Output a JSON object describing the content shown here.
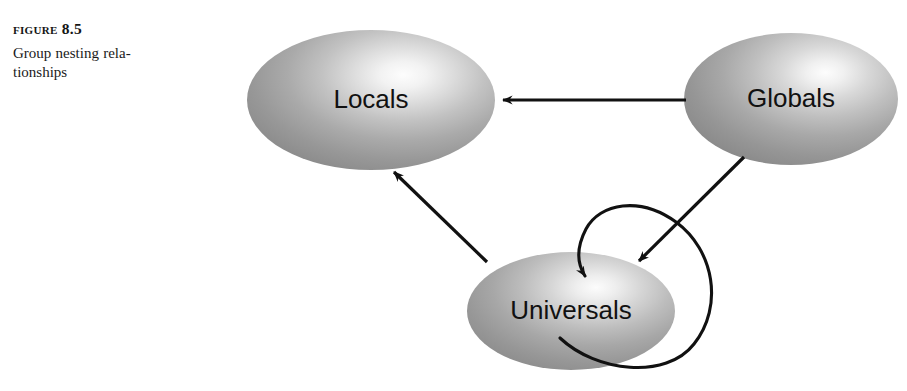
{
  "figure": {
    "label": "Figure 8.5",
    "caption_line_1": "Group nesting rela-",
    "caption_line_2": "tionships",
    "caption_full": "Group nesting relationships"
  },
  "colors": {
    "background": "#ffffff",
    "stroke": "#111111",
    "label_text": "#111111",
    "caption_text": "#1a1a1a",
    "ellipse_highlight": "#fbfbfb",
    "ellipse_mid": "#b4b4b4",
    "ellipse_edge": "#8b8b8b",
    "ellipse_dark": "#7e7e7e"
  },
  "diagram": {
    "type": "node-link-diagram",
    "nodes": [
      {
        "id": "locals",
        "label": "Locals",
        "shape": "ellipse",
        "cx": 371,
        "cy": 100,
        "rx": 124,
        "ry": 70
      },
      {
        "id": "globals",
        "label": "Globals",
        "shape": "ellipse",
        "cx": 791,
        "cy": 99,
        "rx": 107,
        "ry": 66
      },
      {
        "id": "universals",
        "label": "Universals",
        "shape": "ellipse",
        "cx": 571,
        "cy": 311,
        "rx": 104,
        "ry": 59
      }
    ],
    "edges": [
      {
        "id": "globals-to-locals",
        "from": "globals",
        "to": "locals",
        "style": "straight",
        "arrowhead": "at-target"
      },
      {
        "id": "universals-to-locals",
        "from": "universals",
        "to": "locals",
        "style": "straight",
        "arrowhead": "at-target"
      },
      {
        "id": "globals-to-universals",
        "from": "globals",
        "to": "universals",
        "style": "straight",
        "arrowhead": "at-target"
      },
      {
        "id": "universals-self-loop",
        "from": "universals",
        "to": "universals",
        "style": "loop",
        "arrowhead": "at-target"
      }
    ]
  }
}
